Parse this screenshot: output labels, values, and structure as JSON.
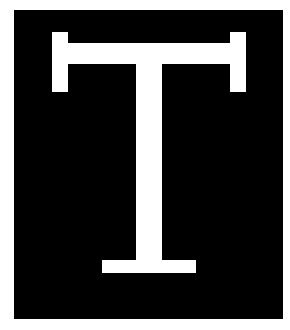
{
  "icon": {
    "name": "letter-t-icon",
    "letter": "T",
    "colors": {
      "background": "#ffffff",
      "box": "#000000",
      "glyph": "#ffffff"
    }
  }
}
